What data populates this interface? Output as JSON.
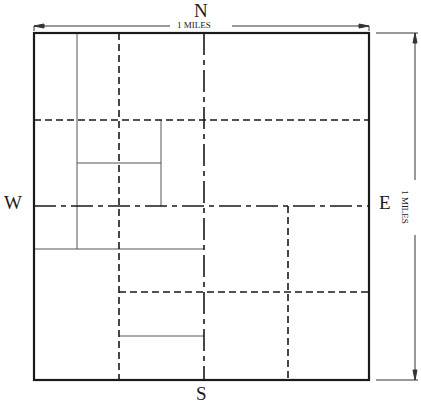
{
  "diagram": {
    "type": "section-map",
    "compass": {
      "north": "N",
      "south": "S",
      "west": "W",
      "east": "E"
    },
    "scale": {
      "horizontal": "1 MILES",
      "vertical": "1 MILES"
    },
    "colors": {
      "line": "#1a1a1a",
      "thin_line": "#555555",
      "background": "#ffffff"
    },
    "outer_boundary": {
      "x": 34,
      "y": 33,
      "width": 335,
      "height": 347
    },
    "line_types": {
      "solid_thin": "parcel boundary",
      "dashed": "quarter-quarter line",
      "dash_dot": "quarter line (center line)"
    }
  }
}
